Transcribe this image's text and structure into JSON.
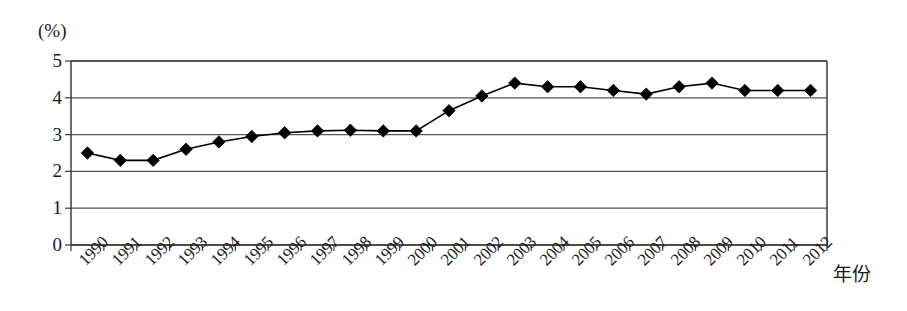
{
  "chart_data": {
    "type": "line",
    "title": "",
    "subtitle": "",
    "xlabel": "年份",
    "ylabel": "(%)",
    "unit_label": "(%)",
    "grid": true,
    "legend": false,
    "legend_position": "none",
    "marker": "diamond",
    "marker_color": "#000000",
    "line_color": "#000000",
    "ylim": [
      0,
      5
    ],
    "yticks": [
      0,
      1,
      2,
      3,
      4,
      5
    ],
    "ytick_labels": [
      "0",
      "1",
      "2",
      "3",
      "4",
      "5"
    ],
    "categories": [
      "1990",
      "1991",
      "1992",
      "1993",
      "1994",
      "1995",
      "1996",
      "1997",
      "1998",
      "1999",
      "2000",
      "2001",
      "2002",
      "2003",
      "2004",
      "2005",
      "2006",
      "2007",
      "2008",
      "2009",
      "2010",
      "2011",
      "2012"
    ],
    "values": [
      2.5,
      2.3,
      2.3,
      2.6,
      2.8,
      2.95,
      3.05,
      3.1,
      3.12,
      3.1,
      3.1,
      3.65,
      4.05,
      4.4,
      4.3,
      4.3,
      4.2,
      4.1,
      4.3,
      4.4,
      4.2,
      4.2,
      4.2
    ]
  },
  "colors": {
    "axis": "#3a3a3a",
    "grid": "#555555",
    "series": "#000000",
    "background": "#ffffff"
  }
}
